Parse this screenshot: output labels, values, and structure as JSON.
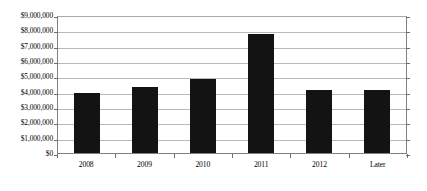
{
  "chart_data": {
    "type": "bar",
    "title": "",
    "subtitle": "",
    "xlabel": "",
    "ylabel": "",
    "categories": [
      "2008",
      "2009",
      "2010",
      "2011",
      "2012",
      "Later"
    ],
    "values": [
      3950000,
      4400000,
      4900000,
      7850000,
      4200000,
      4150000
    ],
    "series": [
      {
        "name": "",
        "values": [
          3950000,
          4400000,
          4900000,
          7850000,
          4200000,
          4150000
        ]
      }
    ],
    "ylim": [
      0,
      9000000
    ],
    "ytick_values": [
      0,
      1000000,
      2000000,
      3000000,
      4000000,
      5000000,
      6000000,
      7000000,
      8000000,
      9000000
    ],
    "ytick_labels": [
      "$0",
      "$1,000,000",
      "$2,000,000",
      "$3,000,000",
      "$4,000,000",
      "$5,000,000",
      "$6,000,000",
      "$7,000,000",
      "$8,000,000",
      "$9,000,000"
    ],
    "grid": true,
    "grid_axis": "y",
    "legend": false,
    "legend_position": "none",
    "bar_color": "#131313",
    "grid_color": "#b9b9b9",
    "axis_color": "#808080",
    "background_color": "#ffffff",
    "annotations": []
  }
}
